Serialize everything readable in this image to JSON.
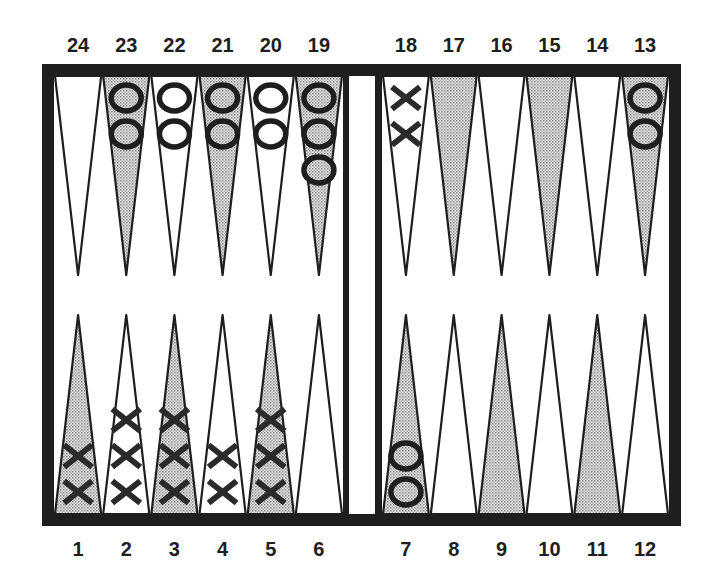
{
  "diagram": {
    "type": "backgammon-board",
    "colors": {
      "frame": "#1e1e1e",
      "shaded_point": "#c9c9c9",
      "light_point": "#ffffff",
      "checker_stroke": "#1e1e1e",
      "background": "#ffffff"
    },
    "top_labels": [
      "24",
      "23",
      "22",
      "21",
      "20",
      "19",
      "18",
      "17",
      "16",
      "15",
      "14",
      "13"
    ],
    "bottom_labels": [
      "1",
      "2",
      "3",
      "4",
      "5",
      "6",
      "7",
      "8",
      "9",
      "10",
      "11",
      "12"
    ],
    "points": [
      {
        "number": 1,
        "row": "bottom",
        "shaded": true,
        "checker": "X",
        "count": 2
      },
      {
        "number": 2,
        "row": "bottom",
        "shaded": false,
        "checker": "X",
        "count": 3
      },
      {
        "number": 3,
        "row": "bottom",
        "shaded": true,
        "checker": "X",
        "count": 3
      },
      {
        "number": 4,
        "row": "bottom",
        "shaded": false,
        "checker": "X",
        "count": 2
      },
      {
        "number": 5,
        "row": "bottom",
        "shaded": true,
        "checker": "X",
        "count": 3
      },
      {
        "number": 6,
        "row": "bottom",
        "shaded": false,
        "checker": "",
        "count": 0
      },
      {
        "number": 7,
        "row": "bottom",
        "shaded": true,
        "checker": "O",
        "count": 2
      },
      {
        "number": 8,
        "row": "bottom",
        "shaded": false,
        "checker": "",
        "count": 0
      },
      {
        "number": 9,
        "row": "bottom",
        "shaded": true,
        "checker": "",
        "count": 0
      },
      {
        "number": 10,
        "row": "bottom",
        "shaded": false,
        "checker": "",
        "count": 0
      },
      {
        "number": 11,
        "row": "bottom",
        "shaded": true,
        "checker": "",
        "count": 0
      },
      {
        "number": 12,
        "row": "bottom",
        "shaded": false,
        "checker": "",
        "count": 0
      },
      {
        "number": 13,
        "row": "top",
        "shaded": true,
        "checker": "O",
        "count": 2
      },
      {
        "number": 14,
        "row": "top",
        "shaded": false,
        "checker": "",
        "count": 0
      },
      {
        "number": 15,
        "row": "top",
        "shaded": true,
        "checker": "",
        "count": 0
      },
      {
        "number": 16,
        "row": "top",
        "shaded": false,
        "checker": "",
        "count": 0
      },
      {
        "number": 17,
        "row": "top",
        "shaded": true,
        "checker": "",
        "count": 0
      },
      {
        "number": 18,
        "row": "top",
        "shaded": false,
        "checker": "X",
        "count": 2
      },
      {
        "number": 19,
        "row": "top",
        "shaded": true,
        "checker": "O",
        "count": 3
      },
      {
        "number": 20,
        "row": "top",
        "shaded": false,
        "checker": "O",
        "count": 2
      },
      {
        "number": 21,
        "row": "top",
        "shaded": true,
        "checker": "O",
        "count": 2
      },
      {
        "number": 22,
        "row": "top",
        "shaded": false,
        "checker": "O",
        "count": 2
      },
      {
        "number": 23,
        "row": "top",
        "shaded": true,
        "checker": "O",
        "count": 2
      },
      {
        "number": 24,
        "row": "top",
        "shaded": false,
        "checker": "",
        "count": 0
      }
    ],
    "summary": {
      "X_total": 15,
      "O_total": 15
    }
  }
}
